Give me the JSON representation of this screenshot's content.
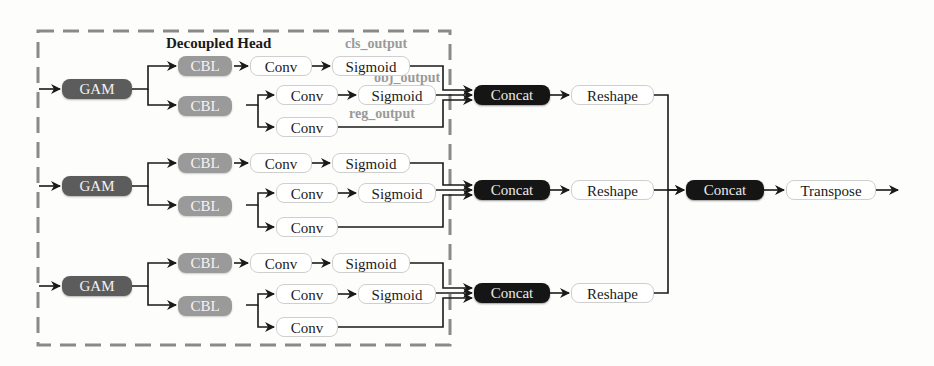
{
  "diagram": {
    "title": "Decoupled Head",
    "colors": {
      "gam": "#5c5c5c",
      "cbl": "#9a9a9a",
      "concat": "#151515",
      "white_node": "#ffffff",
      "dashed_border": "#8a8a8a",
      "output_label": "#9a9a9a"
    },
    "branches": [
      {
        "gam": "GAM",
        "cbl_top": "CBL",
        "cbl_bottom": "CBL",
        "conv_cls": "Conv",
        "sigmoid_cls": "Sigmoid",
        "conv_obj": "Conv",
        "sigmoid_obj": "Sigmoid",
        "conv_reg": "Conv",
        "concat": "Concat",
        "reshape": "Reshape"
      },
      {
        "gam": "GAM",
        "cbl_top": "CBL",
        "cbl_bottom": "CBL",
        "conv_cls": "Conv",
        "sigmoid_cls": "Sigmoid",
        "conv_obj": "Conv",
        "sigmoid_obj": "Sigmoid",
        "conv_reg": "Conv",
        "concat": "Concat",
        "reshape": "Reshape"
      },
      {
        "gam": "GAM",
        "cbl_top": "CBL",
        "cbl_bottom": "CBL",
        "conv_cls": "Conv",
        "sigmoid_cls": "Sigmoid",
        "conv_obj": "Conv",
        "sigmoid_obj": "Sigmoid",
        "conv_reg": "Conv",
        "concat": "Concat",
        "reshape": "Reshape"
      }
    ],
    "output_labels": {
      "cls": "cls_output",
      "obj": "obj_output",
      "reg": "reg_output"
    },
    "final": {
      "concat": "Concat",
      "transpose": "Transpose"
    }
  }
}
